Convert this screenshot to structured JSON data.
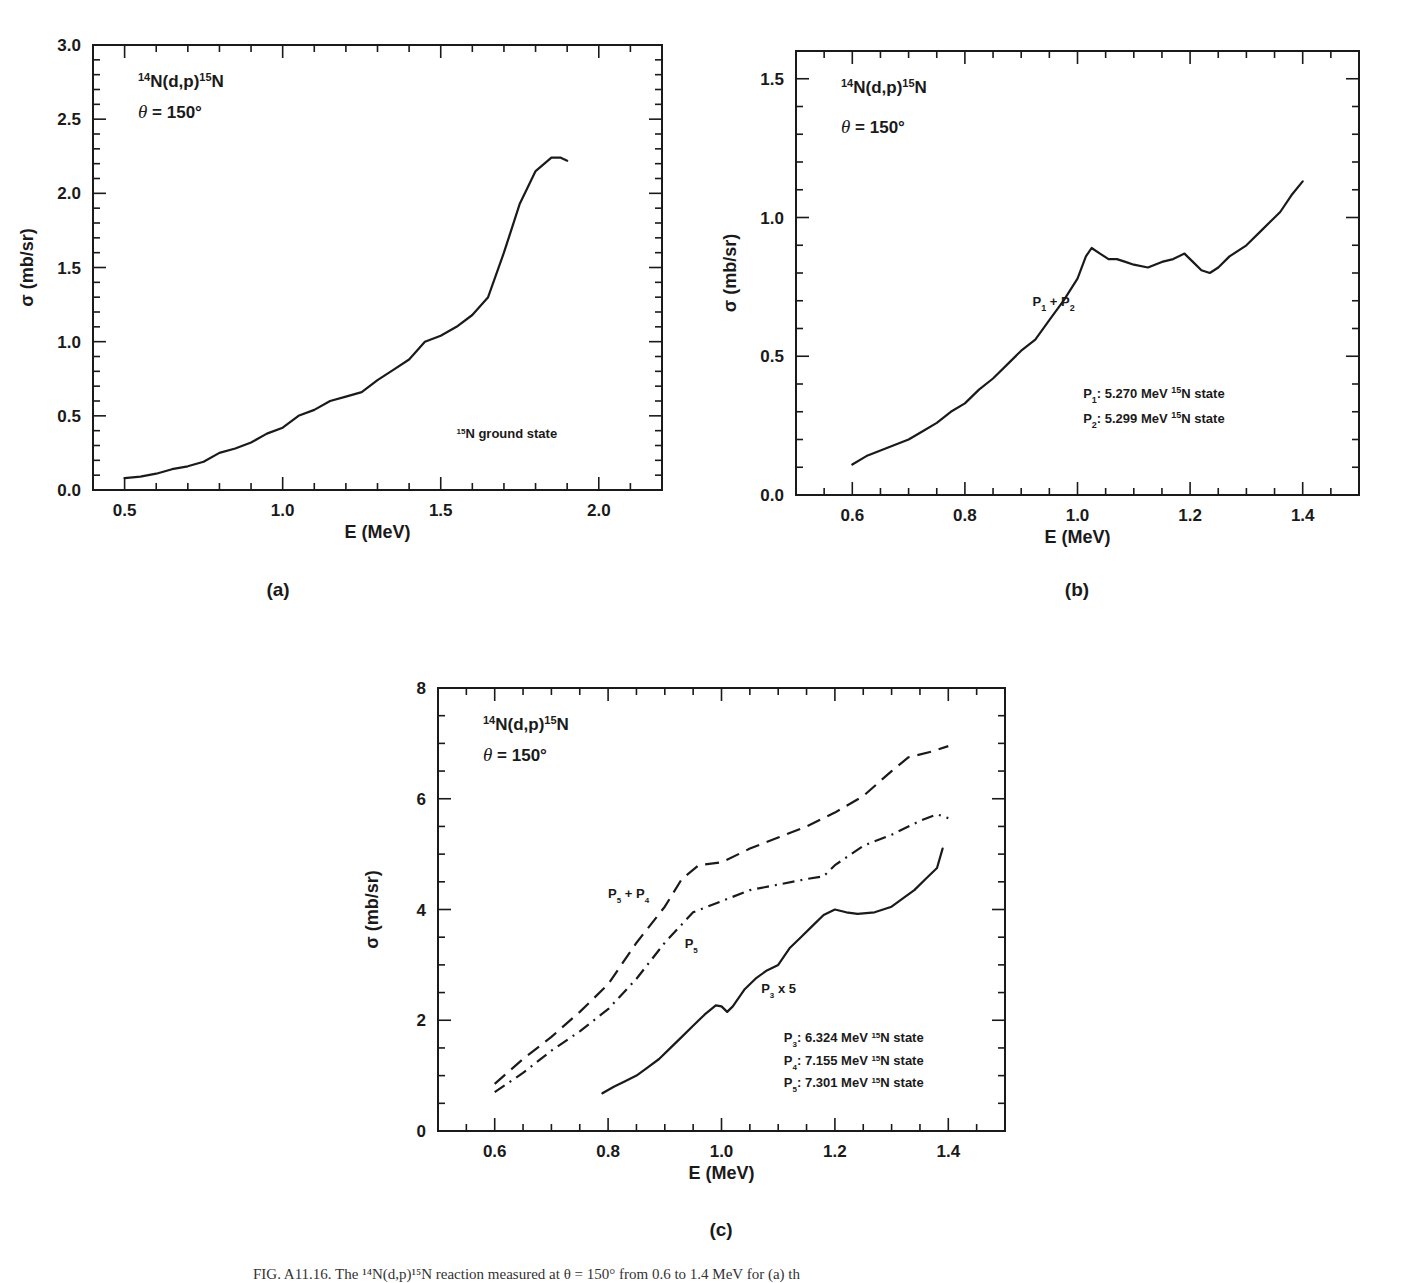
{
  "caption": "FIG. A11.16.  The ¹⁴N(d,p)¹⁵N reaction measured at θ = 150° from 0.6 to 1.4 MeV for (a) th",
  "chart_data": [
    {
      "id": "a",
      "type": "line",
      "panel_label": "(a)",
      "title": "¹⁴N(d,p)¹⁵N",
      "subtitle": "θ = 150°",
      "xlabel": "E (MeV)",
      "ylabel": "σ (mb/sr)",
      "xlim": [
        0.4,
        2.2
      ],
      "ylim": [
        0.0,
        3.0
      ],
      "xticks": [
        0.5,
        1.0,
        1.5,
        2.0
      ],
      "xtick_labels": [
        "0.5",
        "1.0",
        "1.5",
        "2.0"
      ],
      "xminor": 0.1,
      "yticks": [
        0.0,
        0.5,
        1.0,
        1.5,
        2.0,
        2.5,
        3.0
      ],
      "ytick_labels": [
        "0.0",
        "0.5",
        "1.0",
        "1.5",
        "2.0",
        "2.5",
        "3.0"
      ],
      "yminor": 0.1,
      "grid": false,
      "annotations": [
        {
          "text": "¹⁵N ground state",
          "x": 1.55,
          "y": 0.35
        }
      ],
      "series": [
        {
          "name": "¹⁵N ground state",
          "style": "solid",
          "x": [
            0.5,
            0.55,
            0.6,
            0.65,
            0.7,
            0.75,
            0.8,
            0.85,
            0.9,
            0.95,
            1.0,
            1.05,
            1.1,
            1.15,
            1.2,
            1.25,
            1.3,
            1.35,
            1.4,
            1.45,
            1.5,
            1.55,
            1.6,
            1.65,
            1.7,
            1.75,
            1.8,
            1.85,
            1.88,
            1.9
          ],
          "y": [
            0.08,
            0.09,
            0.11,
            0.14,
            0.16,
            0.19,
            0.25,
            0.28,
            0.32,
            0.38,
            0.42,
            0.5,
            0.54,
            0.6,
            0.63,
            0.66,
            0.74,
            0.81,
            0.88,
            1.0,
            1.04,
            1.1,
            1.18,
            1.3,
            1.6,
            1.93,
            2.15,
            2.24,
            2.24,
            2.22
          ]
        }
      ]
    },
    {
      "id": "b",
      "type": "line",
      "panel_label": "(b)",
      "title": "¹⁴N(d,p)¹⁵N",
      "subtitle": "θ = 150°",
      "xlabel": "E (MeV)",
      "ylabel": "σ (mb/sr)",
      "xlim": [
        0.5,
        1.5
      ],
      "ylim": [
        0.0,
        1.6
      ],
      "xticks": [
        0.6,
        0.8,
        1.0,
        1.2,
        1.4
      ],
      "xtick_labels": [
        "0.6",
        "0.8",
        "1.0",
        "1.2",
        "1.4"
      ],
      "xminor": 0.05,
      "yticks": [
        0.0,
        0.5,
        1.0,
        1.5
      ],
      "ytick_labels": [
        "0.0",
        "0.5",
        "1.0",
        "1.5"
      ],
      "yminor": 0.1,
      "grid": false,
      "annotations": [
        {
          "text": "P₁ + P₂",
          "x": 0.92,
          "y": 0.68
        },
        {
          "text": "P₁: 5.270 MeV ¹⁵N state",
          "x": 1.01,
          "y": 0.35
        },
        {
          "text": "P₂: 5.299 MeV ¹⁵N state",
          "x": 1.01,
          "y": 0.26
        }
      ],
      "series": [
        {
          "name": "P₁ + P₂",
          "style": "solid",
          "x": [
            0.6,
            0.625,
            0.65,
            0.675,
            0.7,
            0.725,
            0.75,
            0.775,
            0.8,
            0.825,
            0.85,
            0.875,
            0.9,
            0.925,
            0.95,
            0.975,
            1.0,
            1.015,
            1.025,
            1.04,
            1.055,
            1.07,
            1.085,
            1.1,
            1.125,
            1.15,
            1.17,
            1.19,
            1.205,
            1.22,
            1.235,
            1.25,
            1.27,
            1.3,
            1.33,
            1.36,
            1.38,
            1.4
          ],
          "y": [
            0.11,
            0.14,
            0.16,
            0.18,
            0.2,
            0.23,
            0.26,
            0.3,
            0.33,
            0.38,
            0.42,
            0.47,
            0.52,
            0.56,
            0.63,
            0.7,
            0.78,
            0.86,
            0.89,
            0.87,
            0.85,
            0.85,
            0.84,
            0.83,
            0.82,
            0.84,
            0.85,
            0.87,
            0.84,
            0.81,
            0.8,
            0.82,
            0.86,
            0.9,
            0.96,
            1.02,
            1.08,
            1.13
          ]
        }
      ]
    },
    {
      "id": "c",
      "type": "line",
      "panel_label": "(c)",
      "title": "¹⁴N(d,p)¹⁵N",
      "subtitle": "θ = 150°",
      "xlabel": "E (MeV)",
      "ylabel": "σ (mb/sr)",
      "xlim": [
        0.5,
        1.5
      ],
      "ylim": [
        0,
        8
      ],
      "xticks": [
        0.6,
        0.8,
        1.0,
        1.2,
        1.4
      ],
      "xtick_labels": [
        "0.6",
        "0.8",
        "1.0",
        "1.2",
        "1.4"
      ],
      "xminor": 0.05,
      "yticks": [
        0,
        2,
        4,
        6,
        8
      ],
      "ytick_labels": [
        "0",
        "2",
        "4",
        "6",
        "8"
      ],
      "yminor": 0.5,
      "grid": false,
      "annotations": [
        {
          "text": "P₅ + P₄",
          "x": 0.8,
          "y": 4.2
        },
        {
          "text": "P₅",
          "x": 0.935,
          "y": 3.3
        },
        {
          "text": "P₃ x 5",
          "x": 1.07,
          "y": 2.5
        },
        {
          "text": "P₃: 6.324 MeV ¹⁵N state",
          "x": 1.11,
          "y": 1.6
        },
        {
          "text": "P₄: 7.155 MeV ¹⁵N state",
          "x": 1.11,
          "y": 1.2
        },
        {
          "text": "P₅: 7.301 MeV ¹⁵N state",
          "x": 1.11,
          "y": 0.8
        }
      ],
      "series": [
        {
          "name": "P₅ + P₄",
          "style": "dashed",
          "x": [
            0.6,
            0.65,
            0.7,
            0.75,
            0.8,
            0.85,
            0.9,
            0.93,
            0.96,
            1.0,
            1.05,
            1.1,
            1.15,
            1.2,
            1.25,
            1.3,
            1.33,
            1.37,
            1.4
          ],
          "y": [
            0.85,
            1.3,
            1.7,
            2.15,
            2.65,
            3.4,
            4.05,
            4.55,
            4.8,
            4.85,
            5.1,
            5.3,
            5.5,
            5.75,
            6.05,
            6.5,
            6.75,
            6.85,
            6.95
          ]
        },
        {
          "name": "P₅",
          "style": "dash-dot",
          "x": [
            0.6,
            0.65,
            0.7,
            0.75,
            0.8,
            0.85,
            0.9,
            0.95,
            1.0,
            1.05,
            1.1,
            1.15,
            1.18,
            1.2,
            1.25,
            1.3,
            1.35,
            1.38,
            1.4
          ],
          "y": [
            0.7,
            1.05,
            1.45,
            1.8,
            2.2,
            2.75,
            3.4,
            3.95,
            4.15,
            4.35,
            4.45,
            4.55,
            4.6,
            4.8,
            5.15,
            5.35,
            5.6,
            5.72,
            5.65
          ]
        },
        {
          "name": "P₃ x 5",
          "style": "solid",
          "x": [
            0.79,
            0.81,
            0.83,
            0.85,
            0.87,
            0.89,
            0.91,
            0.93,
            0.95,
            0.97,
            0.99,
            1.0,
            1.01,
            1.02,
            1.04,
            1.06,
            1.08,
            1.1,
            1.12,
            1.14,
            1.16,
            1.18,
            1.2,
            1.22,
            1.24,
            1.27,
            1.3,
            1.32,
            1.34,
            1.36,
            1.38,
            1.39
          ],
          "y": [
            0.68,
            0.8,
            0.9,
            1.0,
            1.15,
            1.3,
            1.5,
            1.7,
            1.9,
            2.1,
            2.27,
            2.25,
            2.15,
            2.25,
            2.55,
            2.75,
            2.9,
            3.0,
            3.3,
            3.5,
            3.7,
            3.9,
            4.0,
            3.95,
            3.92,
            3.95,
            4.05,
            4.2,
            4.35,
            4.55,
            4.75,
            5.1
          ]
        }
      ]
    }
  ],
  "layout": {
    "panels": [
      {
        "id": "a",
        "left": 93,
        "top": 45,
        "right": 662,
        "bottom": 490,
        "label_x": 278,
        "label_y": 596
      },
      {
        "id": "b",
        "left": 796,
        "top": 51,
        "right": 1359,
        "bottom": 495,
        "label_x": 1077,
        "label_y": 596
      },
      {
        "id": "c",
        "left": 438,
        "top": 688,
        "right": 1005,
        "bottom": 1131,
        "label_x": 721,
        "label_y": 1236
      }
    ],
    "ink_color": "#1a1a1a"
  }
}
